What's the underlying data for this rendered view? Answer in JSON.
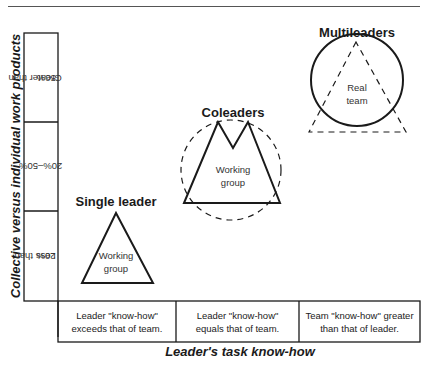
{
  "y_axis": {
    "title": "Collective versus individual work products",
    "categories": [
      {
        "line1": "Greater than",
        "line2": "50%"
      },
      {
        "line1": "20%–50%",
        "line2": ""
      },
      {
        "line1": "Less than",
        "line2": "20%"
      }
    ]
  },
  "x_axis": {
    "title": "Leader's task know-how",
    "categories": [
      {
        "line1": "Leader \"know-how\"",
        "line2": "exceeds that of team."
      },
      {
        "line1": "Leader \"know-how\"",
        "line2": "equals that of team."
      },
      {
        "line1": "Team \"know-how\" greater",
        "line2": "than that of leader."
      }
    ]
  },
  "shapes": {
    "single_leader": {
      "title": "Single leader",
      "inner_line1": "Working",
      "inner_line2": "group"
    },
    "coleaders": {
      "title": "Coleaders",
      "inner_line1": "Working",
      "inner_line2": "group"
    },
    "multileaders": {
      "title": "Multileaders",
      "inner_line1": "Real",
      "inner_line2": "team"
    }
  },
  "colors": {
    "stroke": "#1a1a1a",
    "background": "#ffffff"
  }
}
